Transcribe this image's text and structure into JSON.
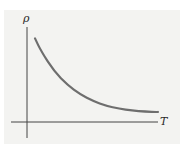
{
  "chart_data": {
    "type": "line",
    "title": "",
    "xlabel": "T",
    "ylabel": "ρ",
    "grid": false,
    "legend": null,
    "series": [
      {
        "name": "ρ(T)",
        "color": "#6e6e6e",
        "x": [
          0.05,
          0.1,
          0.2,
          0.3,
          0.4,
          0.5,
          0.6,
          0.7,
          0.8,
          0.9,
          1.0
        ],
        "y": [
          0.88,
          0.74,
          0.53,
          0.39,
          0.29,
          0.22,
          0.17,
          0.14,
          0.12,
          0.11,
          0.105
        ]
      }
    ],
    "xlim": [
      0,
      1
    ],
    "ylim": [
      0,
      1
    ]
  },
  "labels": {
    "y_axis": "ρ",
    "x_axis": "T"
  },
  "colors": {
    "background": "#f3f3f1",
    "axis": "#444444",
    "curve": "#6e6e6e"
  }
}
